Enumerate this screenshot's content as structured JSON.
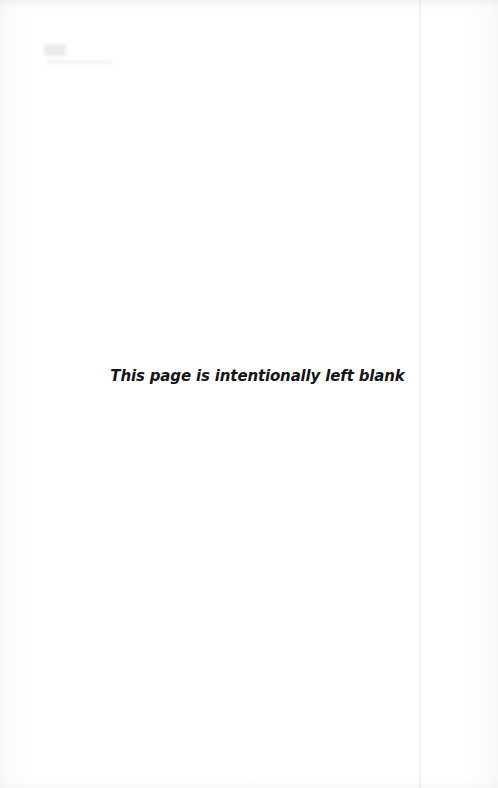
{
  "document": {
    "page_kind": "intentionally-blank-page",
    "background_color": "#ffffff",
    "text_color": "#151515"
  },
  "notice": {
    "message": "This page is intentionally left blank"
  },
  "artifacts": {
    "scan_streak_color": "#bebec4",
    "edge_shadow_color": "#b0b0b4",
    "ghost_mark_color": "#babac0"
  }
}
